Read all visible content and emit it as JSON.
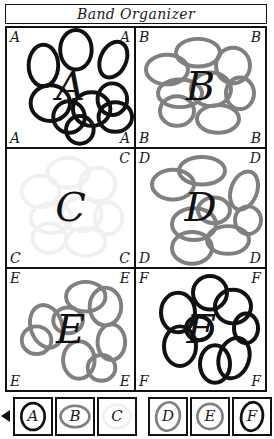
{
  "window": {
    "title": "Band Organizer"
  },
  "colors": {
    "black": "#111111",
    "dark": "#1a1a1a",
    "gray": "#808080",
    "faint": "#f0f0f0",
    "frame": "#111111",
    "background": "#ffffff"
  },
  "panels": [
    {
      "id": "panel-a",
      "letter": "A",
      "color_key": "black",
      "stroke": "#111111",
      "corners": {
        "tl": "A",
        "tr": "A",
        "bl": "A",
        "br": "A"
      },
      "ellipse_count": 9
    },
    {
      "id": "panel-b",
      "letter": "B",
      "color_key": "gray",
      "stroke": "#808080",
      "corners": {
        "tl": "B",
        "tr": "B",
        "bl": "B",
        "br": "B"
      },
      "ellipse_count": 8
    },
    {
      "id": "panel-c",
      "letter": "C",
      "color_key": "faint",
      "stroke": "#f0f0f0",
      "corners": {
        "tl": "",
        "tr": "C",
        "bl": "C",
        "br": "C"
      },
      "ellipse_count": 8
    },
    {
      "id": "panel-d",
      "letter": "D",
      "color_key": "gray",
      "stroke": "#808080",
      "corners": {
        "tl": "D",
        "tr": "D",
        "bl": "D",
        "br": "D"
      },
      "ellipse_count": 8
    },
    {
      "id": "panel-e",
      "letter": "E",
      "color_key": "gray",
      "stroke": "#808080",
      "corners": {
        "tl": "E",
        "tr": "E",
        "bl": "E",
        "br": "E"
      },
      "ellipse_count": 8
    },
    {
      "id": "panel-f",
      "letter": "F",
      "color_key": "black",
      "stroke": "#111111",
      "corners": {
        "tl": "F",
        "tr": "F",
        "bl": "F",
        "br": "F"
      },
      "ellipse_count": 8
    }
  ],
  "legend": {
    "arrow_icon": "left-arrow-icon",
    "cells": [
      {
        "label": "A",
        "stroke": "#111111"
      },
      {
        "label": "B",
        "stroke": "#808080"
      },
      {
        "label": "C",
        "stroke": "#f0f0f0"
      },
      {
        "label": "D",
        "stroke": "#808080"
      },
      {
        "label": "E",
        "stroke": "#808080"
      },
      {
        "label": "F",
        "stroke": "#111111"
      }
    ]
  }
}
